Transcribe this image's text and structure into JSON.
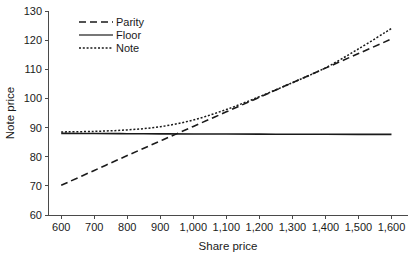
{
  "chart_data": {
    "type": "line",
    "title": "",
    "xlabel": "Share price",
    "ylabel": "Note price",
    "xlim": [
      560,
      1650
    ],
    "ylim": [
      60,
      130
    ],
    "grid": false,
    "legend_position": "top-left",
    "xticks": [
      600,
      700,
      800,
      900,
      1000,
      1100,
      1200,
      1300,
      1400,
      1500,
      1600
    ],
    "xtick_labels": [
      "600",
      "700",
      "800",
      "900",
      "1,000",
      "1,100",
      "1,200",
      "1,300",
      "1,400",
      "1,500",
      "1,600"
    ],
    "yticks": [
      60,
      70,
      80,
      90,
      100,
      110,
      120,
      130
    ],
    "ytick_labels": [
      "60",
      "70",
      "80",
      "90",
      "100",
      "110",
      "120",
      "130"
    ],
    "x": [
      600,
      700,
      800,
      900,
      1000,
      1100,
      1200,
      1300,
      1400,
      1500,
      1600
    ],
    "series": [
      {
        "name": "Parity",
        "label": "Parity",
        "style": "dashed",
        "color": "#1a1a1a",
        "values": [
          70.2,
          75.3,
          80.4,
          85.4,
          90.4,
          95.4,
          100.4,
          105.4,
          110.4,
          115.4,
          120.4
        ]
      },
      {
        "name": "Floor",
        "label": "Floor",
        "style": "solid",
        "color": "#4a4a4a",
        "values": [
          88.0,
          87.95,
          87.9,
          87.85,
          87.8,
          87.78,
          87.75,
          87.72,
          87.7,
          87.68,
          87.65
        ]
      },
      {
        "name": "Note",
        "label": "Note",
        "style": "dotted",
        "color": "#1a1a1a",
        "values": [
          88.5,
          88.7,
          89.2,
          90.3,
          92.6,
          96.2,
          100.6,
          105.4,
          110.5,
          117.0,
          124.0
        ]
      }
    ]
  },
  "legend": {
    "items": [
      {
        "label": "Parity"
      },
      {
        "label": "Floor"
      },
      {
        "label": "Note"
      }
    ]
  },
  "axes": {
    "x_title": "Share price",
    "y_title": "Note price"
  }
}
